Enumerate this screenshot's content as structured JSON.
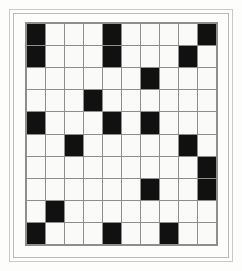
{
  "figure": {
    "kind": "crossword-grid-pattern",
    "background_color": "#fdfdfc",
    "frame": {
      "outer_border_color": "#c9c9c7",
      "inner_border_color": "#b9b9b7"
    }
  },
  "grid": {
    "rows": 10,
    "columns": 10,
    "empty_cell_color": "#fafaf8",
    "filled_cell_color": "#111111",
    "gridline_color": "#8e8e8c",
    "filled_symbol": "black-square",
    "empty_symbol": "white-square",
    "cells": [
      [
        1,
        0,
        0,
        0,
        1,
        0,
        0,
        0,
        0,
        1
      ],
      [
        1,
        0,
        0,
        0,
        1,
        0,
        0,
        0,
        1,
        0
      ],
      [
        0,
        0,
        0,
        0,
        0,
        0,
        1,
        0,
        0,
        0
      ],
      [
        0,
        0,
        0,
        1,
        0,
        0,
        0,
        0,
        0,
        0
      ],
      [
        1,
        0,
        0,
        0,
        1,
        0,
        1,
        0,
        0,
        0
      ],
      [
        0,
        0,
        1,
        0,
        0,
        0,
        0,
        0,
        1,
        0
      ],
      [
        0,
        0,
        0,
        0,
        0,
        0,
        0,
        0,
        0,
        1
      ],
      [
        0,
        0,
        0,
        0,
        0,
        0,
        1,
        0,
        0,
        1
      ],
      [
        0,
        1,
        0,
        0,
        0,
        0,
        0,
        0,
        0,
        0
      ],
      [
        1,
        0,
        0,
        0,
        1,
        0,
        0,
        1,
        0,
        0
      ]
    ],
    "filled_count": 22,
    "empty_count": 78
  }
}
